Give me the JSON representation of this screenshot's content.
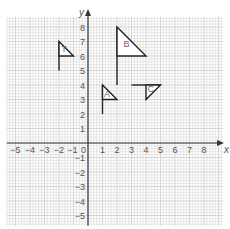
{
  "diagram": {
    "type": "coordinate-grid",
    "title": "",
    "axes": {
      "x_label": "x",
      "y_label": "y",
      "x_ticks": [
        -5,
        -4,
        -3,
        -2,
        -1,
        1,
        2,
        3,
        4,
        5,
        6,
        7,
        8
      ],
      "y_ticks": [
        8,
        7,
        6,
        5,
        4,
        3,
        2,
        1,
        -1,
        -2,
        -3,
        -4,
        -5
      ],
      "origin_label": "0",
      "x_range": [
        -5.6,
        9.3
      ],
      "y_range": [
        -5.7,
        8.7
      ]
    },
    "colors": {
      "grid_minor": "#d9d9d9",
      "grid_major": "#bdbdbd",
      "axis": "#333333",
      "flag": "#222222",
      "text": "#555555"
    },
    "flags": [
      {
        "label": "T",
        "pole": [
          [
            -2,
            5
          ],
          [
            -2,
            7
          ]
        ],
        "triangle": [
          [
            -2,
            7
          ],
          [
            -2,
            6
          ],
          [
            -1,
            6
          ]
        ],
        "label_pos": [
          -1.85,
          6.3
        ]
      },
      {
        "label": "B",
        "pole": [
          [
            2,
            4
          ],
          [
            2,
            8
          ]
        ],
        "triangle": [
          [
            2,
            8
          ],
          [
            2,
            6
          ],
          [
            4,
            6
          ]
        ],
        "label_pos": [
          2.45,
          6.6
        ]
      },
      {
        "label": "A",
        "pole": [
          [
            1,
            2
          ],
          [
            1,
            4
          ]
        ],
        "triangle": [
          [
            1,
            4
          ],
          [
            1,
            3
          ],
          [
            2,
            3
          ]
        ],
        "label_pos": [
          1.1,
          3.2
        ]
      },
      {
        "label": "C",
        "pole": [
          [
            3,
            4
          ],
          [
            5,
            4
          ]
        ],
        "triangle": [
          [
            4,
            4
          ],
          [
            5,
            4
          ],
          [
            4,
            3
          ]
        ],
        "label_pos": [
          4.1,
          3.55
        ]
      }
    ]
  }
}
